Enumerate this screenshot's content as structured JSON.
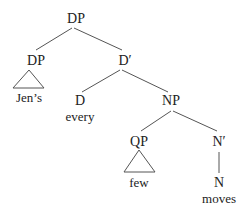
{
  "tree": {
    "root": {
      "label": "DP"
    },
    "spec_dp": {
      "label": "DP",
      "terminal": "Jen’s"
    },
    "d_bar": {
      "label": "D′"
    },
    "d": {
      "label": "D",
      "terminal": "every"
    },
    "np": {
      "label": "NP"
    },
    "qp": {
      "label": "QP",
      "terminal": "few"
    },
    "n_bar": {
      "label": "N′"
    },
    "n": {
      "label": "N",
      "terminal": "moves"
    }
  },
  "colors": {
    "text": "#222222",
    "edge": "#555555",
    "background": "#ffffff"
  }
}
